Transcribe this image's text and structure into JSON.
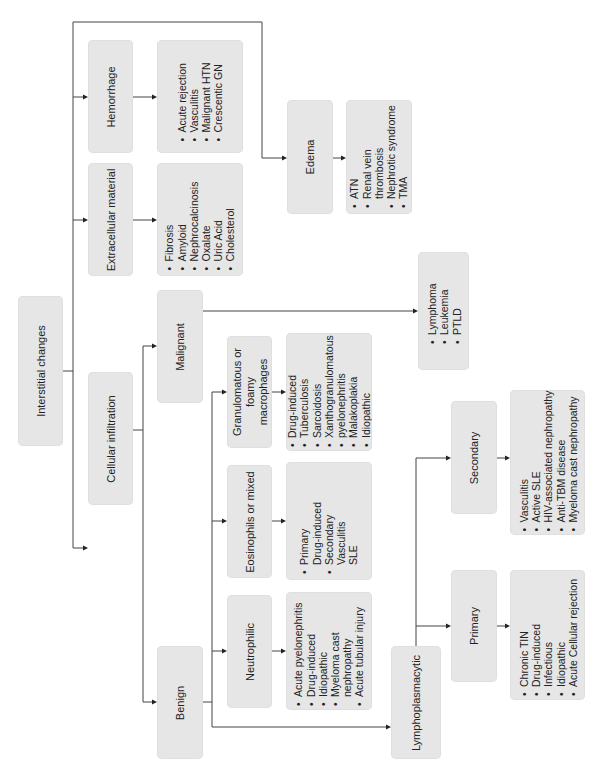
{
  "diagram": {
    "root": {
      "label": "Interstitial changes"
    },
    "categories": {
      "hemorrhage": {
        "label": "Hemorrhage",
        "items": [
          "Acute rejection",
          "Vasculitis",
          "Malignant HTN",
          "Crescentic GN"
        ]
      },
      "extracellular": {
        "label": "Extracellular material",
        "items": [
          "Fibrosis",
          "Amyloid",
          "Nephrocalcinosis",
          "Oxalate",
          "Uric Acid",
          "Cholesterol"
        ]
      },
      "edema": {
        "label": "Edema",
        "items": [
          "ATN",
          "Renal vein",
          "thrombosis",
          "Nephrotic syndrome",
          "TMA"
        ]
      },
      "cellular": {
        "label": "Cellular infiltration"
      }
    },
    "cellular": {
      "malignant": {
        "label": "Malignant",
        "items": [
          "Lymphoma",
          "Leukemia",
          "PTLD"
        ]
      },
      "benign": {
        "label": "Benign"
      },
      "granulomatous": {
        "label_lines": [
          "Granulomatous or",
          "foamy",
          "macrophages"
        ],
        "items": [
          "Drug-induced",
          "Tuberculosis",
          "Sarcoidosis",
          "Xanthogranulomatous",
          "pyelonephritis",
          "Malakoplakia",
          "Idiopathic"
        ]
      },
      "eosinophils": {
        "label": "Eosinophils or mixed",
        "items": [
          "Primary",
          "Drug-induced",
          "Secondary",
          "Vasculitis",
          "SLE"
        ]
      },
      "neutrophilic": {
        "label": "Neutrophilic",
        "items": [
          "Acute pyelonephritis",
          "Drug-induced",
          "Idiopathic",
          "Myeloma cast",
          "nephropathy",
          "Acute tubular injury"
        ]
      },
      "lymphoplasmacytic": {
        "label": "Lymphoplasmacytic"
      },
      "primary": {
        "label": "Primary",
        "items": [
          "Chronic TIN",
          "Drug-induced",
          "Infectious",
          "Idiopathic",
          "Acute Cellular rejection"
        ]
      },
      "secondary": {
        "label": "Secondary",
        "items": [
          "Vasculitis",
          "Active SLE",
          "HIV-associated nephropathy",
          "Anti-TBM disease",
          "Myeloma cast nephropathy"
        ]
      }
    },
    "colors": {
      "box_fill": "#e6e6e6",
      "line": "#444444",
      "background": "#ffffff"
    }
  }
}
